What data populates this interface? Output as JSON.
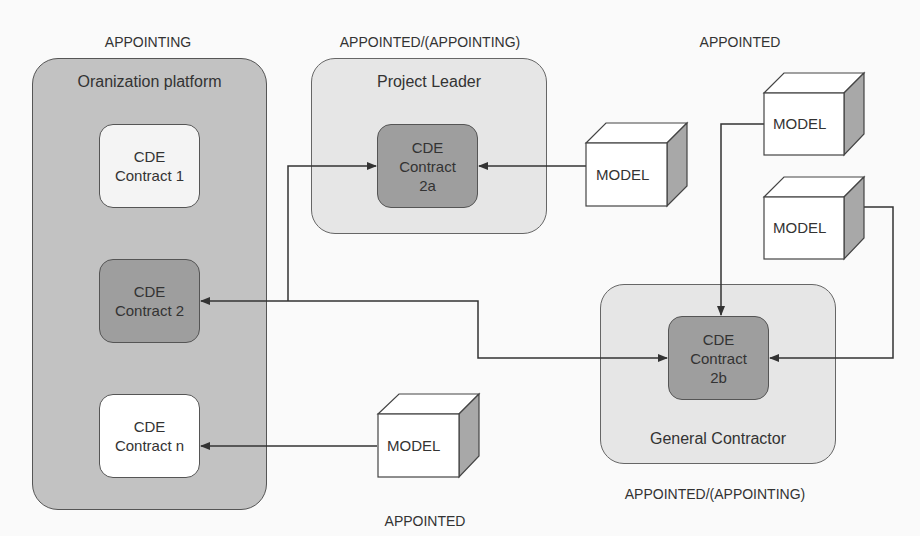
{
  "diagram": {
    "role_labels": {
      "org_top": "APPOINTING",
      "pl_top": "APPOINTED/(APPOINTING)",
      "models_top": "APPOINTED",
      "model_bottom": "APPOINTED",
      "gc_bottom": "APPOINTED/(APPOINTING)"
    },
    "containers": {
      "organization": {
        "title": "Oranization platform",
        "color": "#c2c2c2"
      },
      "project_leader": {
        "title": "Project Leader",
        "color": "#e6e6e6"
      },
      "general_contractor": {
        "title": "General Contractor",
        "color": "#e6e6e6"
      }
    },
    "cde_boxes": {
      "c1": {
        "line1": "CDE",
        "line2": "Contract 1",
        "line3": ""
      },
      "c2": {
        "line1": "CDE",
        "line2": "Contract 2",
        "line3": ""
      },
      "cn": {
        "line1": "CDE",
        "line2": "Contract n",
        "line3": ""
      },
      "c2a": {
        "line1": "CDE",
        "line2": "Contract",
        "line3": "2a"
      },
      "c2b": {
        "line1": "CDE",
        "line2": "Contract",
        "line3": "2b"
      }
    },
    "models": {
      "m1": "MODEL",
      "m2": "MODEL",
      "m3": "MODEL",
      "m4": "MODEL"
    },
    "colors": {
      "dark_cde": "#9e9e9e",
      "light_cde": "#f4f4f4",
      "white_cde": "#ffffff",
      "line": "#333333",
      "cube_side": "#a8a8a8"
    }
  }
}
